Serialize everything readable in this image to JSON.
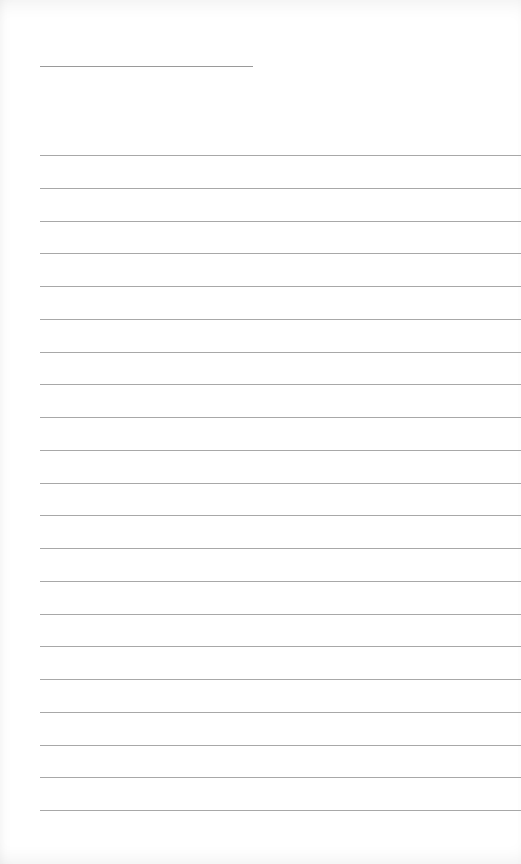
{
  "page": {
    "type": "blank-lined-sheet",
    "background": "#ffffff",
    "line_color": "#a8a8a8"
  },
  "header_line": {
    "x": 40,
    "y": 66,
    "width": 213
  },
  "ruled_lines": {
    "count": 21,
    "first_y": 155,
    "last_y": 810,
    "left_margin": 40
  }
}
